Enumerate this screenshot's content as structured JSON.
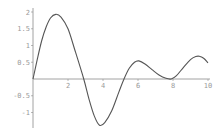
{
  "chart_data": {
    "type": "line",
    "title": "",
    "xlabel": "",
    "ylabel": "",
    "xlim": [
      0,
      10
    ],
    "ylim": [
      -1.47,
      2.0
    ],
    "grid": false,
    "legend": null,
    "x_ticks": [
      2,
      4,
      6,
      8,
      10
    ],
    "x_tick_labels": [
      "2",
      "4",
      "6",
      "8",
      "10"
    ],
    "y_ticks": [
      -1,
      -0.5,
      0.5,
      1,
      1.5,
      2
    ],
    "y_tick_labels": [
      "-1",
      "-0.5",
      "0.5",
      "1",
      "1.5",
      "2"
    ],
    "series": [
      {
        "name": "f(x)",
        "color": "#555555",
        "x": [
          0,
          0.25,
          0.5,
          0.75,
          1.0,
          1.3,
          1.6,
          2.0,
          2.4,
          2.9,
          3.2,
          3.5,
          3.8,
          4.1,
          4.5,
          4.9,
          5.2,
          5.5,
          5.8,
          6.05,
          6.4,
          6.8,
          7.2,
          7.6,
          7.9,
          8.2,
          8.6,
          9.0,
          9.3,
          9.5,
          9.75,
          10.0
        ],
        "values": [
          0,
          0.6,
          1.15,
          1.55,
          1.82,
          1.93,
          1.85,
          1.5,
          0.85,
          0.0,
          -0.6,
          -1.1,
          -1.38,
          -1.3,
          -0.95,
          -0.4,
          0.0,
          0.32,
          0.5,
          0.54,
          0.45,
          0.28,
          0.12,
          0.02,
          0.0,
          0.1,
          0.35,
          0.58,
          0.67,
          0.68,
          0.62,
          0.48
        ]
      }
    ]
  },
  "plot_frame": {
    "origin_px": [
      33,
      79
    ],
    "px_per_x": 17.5,
    "px_per_y": 33.5,
    "x_axis_end_px": 210,
    "y_axis_top_px": 8,
    "y_axis_bottom_px": 128,
    "axis_color": "#8a8a8a",
    "label_color": "#9a9a9a"
  }
}
